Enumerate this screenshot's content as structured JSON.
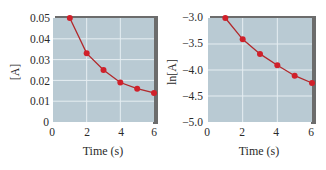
{
  "chart_data": [
    {
      "type": "line",
      "title": "",
      "xlabel": "Time (s)",
      "ylabel": "[A]",
      "x": [
        1,
        2,
        3,
        4,
        5,
        6
      ],
      "series": [
        {
          "name": "[A]",
          "values": [
            0.05,
            0.033,
            0.025,
            0.019,
            0.016,
            0.014
          ]
        }
      ],
      "xlim": [
        0,
        6
      ],
      "ylim": [
        0,
        0.05
      ],
      "xticks": [
        "0",
        "2",
        "4",
        "6"
      ],
      "yticks": [
        "0",
        "0.01",
        "0.02",
        "0.03",
        "0.04",
        "0.05"
      ],
      "grid": true,
      "legend": "none",
      "colors": {
        "plot_bg": "#b9cad3",
        "grid": "#e6eef2",
        "line": "#b2282b",
        "marker": "#d0202a",
        "shadow": "#6c6c6c"
      }
    },
    {
      "type": "line",
      "title": "",
      "xlabel": "Time (s)",
      "ylabel": "ln[A]",
      "x": [
        1,
        2,
        3,
        4,
        5,
        6
      ],
      "series": [
        {
          "name": "ln[A]",
          "values": [
            -3.0,
            -3.41,
            -3.69,
            -3.91,
            -4.11,
            -4.25
          ]
        }
      ],
      "xlim": [
        0,
        6
      ],
      "ylim": [
        -5.0,
        -3.0
      ],
      "xticks": [
        "0",
        "2",
        "4",
        "6"
      ],
      "yticks": [
        "-5.0",
        "-4.5",
        "-4.0",
        "-3.5",
        "-3.0"
      ],
      "grid": true,
      "legend": "none",
      "colors": {
        "plot_bg": "#b9cad3",
        "grid": "#e6eef2",
        "line": "#b2282b",
        "marker": "#d0202a",
        "shadow": "#6c6c6c"
      }
    }
  ],
  "left": {
    "ylabel": "[A]",
    "xlabel": "Time (s)",
    "yticks": [
      "0.05",
      "0.04",
      "0.03",
      "0.02",
      "0.01",
      "0"
    ],
    "xticks": [
      "0",
      "2",
      "4",
      "6"
    ]
  },
  "right": {
    "ylabel": "ln[A]",
    "xlabel": "Time (s)",
    "yticks": [
      "−3.0",
      "−3.5",
      "−4.0",
      "−4.5",
      "−5.0"
    ],
    "xticks": [
      "0",
      "2",
      "4",
      "6"
    ]
  }
}
